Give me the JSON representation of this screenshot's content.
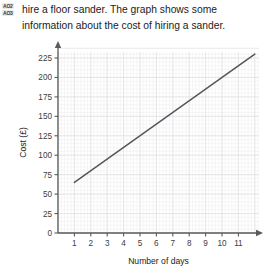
{
  "markers": {
    "items": [
      {
        "label": "AO2"
      },
      {
        "label": "AO3"
      }
    ]
  },
  "question": {
    "line1": "hire a floor sander. The graph shows some",
    "line2": "information about the cost of hiring a sander."
  },
  "chart_data": {
    "type": "line",
    "title": "",
    "xlabel": "Number of days",
    "ylabel": "Cost (£)",
    "xlim": [
      0,
      12
    ],
    "ylim": [
      0,
      237.5
    ],
    "xticks": [
      1,
      2,
      3,
      4,
      5,
      6,
      7,
      8,
      9,
      10,
      11
    ],
    "xtick_labels": [
      "1",
      "2",
      "3",
      "4",
      "5",
      "6",
      "7",
      "8",
      "9",
      "10",
      "11"
    ],
    "yticks": [
      0,
      25,
      50,
      75,
      100,
      125,
      150,
      175,
      200,
      225
    ],
    "ytick_labels": [
      "0",
      "25",
      "50",
      "75",
      "100",
      "125",
      "150",
      "175",
      "200",
      "225"
    ],
    "grid": true,
    "grid_color": "#e2e2e4",
    "minor_grid": true,
    "axis_color": "#5a5a5a",
    "legend": null,
    "series": [
      {
        "name": "Cost of hiring a sander",
        "color": "#55575a",
        "x": [
          1,
          12
        ],
        "y": [
          65,
          230
        ]
      }
    ],
    "annotations": []
  }
}
